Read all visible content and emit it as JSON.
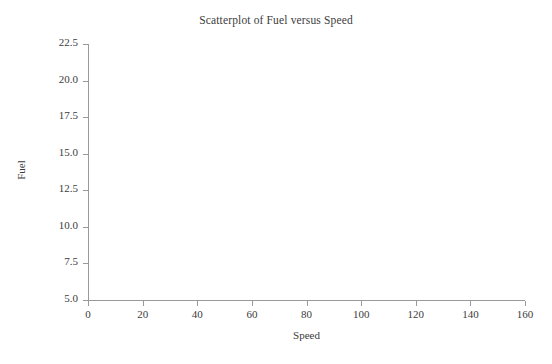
{
  "chart_data": {
    "type": "scatter",
    "title": "Scatterplot of Fuel versus Speed",
    "xlabel": "Speed",
    "ylabel": "Fuel",
    "xlim": [
      0,
      160
    ],
    "ylim": [
      5.0,
      22.5
    ],
    "xticks": [
      "0",
      "20",
      "40",
      "60",
      "80",
      "100",
      "120",
      "140",
      "160"
    ],
    "xtick_values": [
      0,
      20,
      40,
      60,
      80,
      100,
      120,
      140,
      160
    ],
    "yticks": [
      "5.0",
      "7.5",
      "10.0",
      "12.5",
      "15.0",
      "17.5",
      "20.0",
      "22.5"
    ],
    "ytick_values": [
      5.0,
      7.5,
      10.0,
      12.5,
      15.0,
      17.5,
      20.0,
      22.5
    ],
    "grid": false,
    "legend": false,
    "series": [
      {
        "name": "Fuel vs Speed",
        "x": [],
        "y": []
      }
    ],
    "annotations": [],
    "note": "Empty plot axes - no data points are drawn in the plotting region",
    "colors": {
      "background": "#ffffff",
      "axis": "#9a9a9a",
      "text": "#3c3c3c",
      "marker": "#2f2f2f"
    }
  }
}
